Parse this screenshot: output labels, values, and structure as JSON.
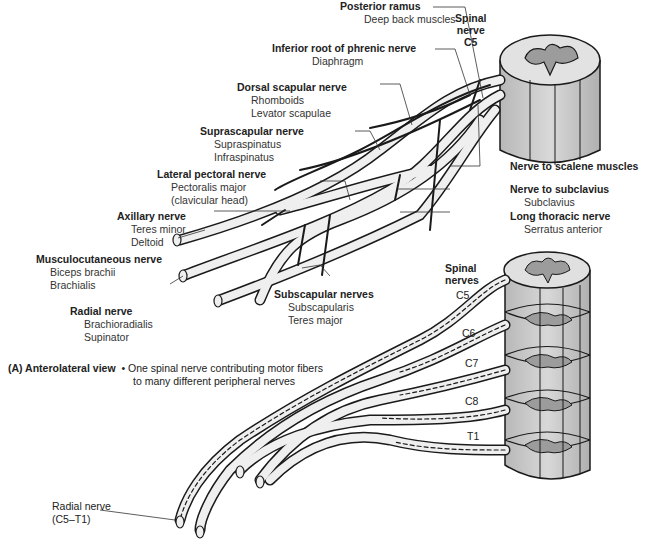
{
  "figure": {
    "panel_label": "(A) Anterolateral view",
    "caption_note": "• One spinal nerve contributing motor fibers",
    "caption_note_2": "to many different peripheral nerves"
  },
  "top_diagram": {
    "spinal_label": {
      "line1": "Spinal",
      "line2": "nerve",
      "segment": "C5"
    },
    "labels": [
      {
        "title": "Posterior ramus",
        "sub": [
          "Deep back muscles"
        ]
      },
      {
        "title": "Inferior root of phrenic nerve",
        "sub": [
          "Diaphragm"
        ]
      },
      {
        "title": "Dorsal scapular nerve",
        "sub": [
          "Rhomboids",
          "Levator scapulae"
        ]
      },
      {
        "title": "Suprascapular nerve",
        "sub": [
          "Supraspinatus",
          "Infraspinatus"
        ]
      },
      {
        "title": "Lateral pectoral nerve",
        "sub": [
          "Pectoralis major",
          "(clavicular head)"
        ]
      },
      {
        "title": "Axillary nerve",
        "sub": [
          "Teres minor",
          "Deltoid"
        ]
      },
      {
        "title": "Musculocutaneous nerve",
        "sub": [
          "Biceps brachii",
          "Brachialis"
        ]
      },
      {
        "title": "Radial nerve",
        "sub": [
          "Brachioradialis",
          "Supinator"
        ]
      },
      {
        "title": "Subscapular nerves",
        "sub": [
          "Subscapularis",
          "Teres major"
        ]
      },
      {
        "title": "Nerve to scalene muscles",
        "sub": []
      },
      {
        "title": "Nerve to subclavius",
        "sub": [
          "Subclavius"
        ]
      },
      {
        "title": "Long thoracic nerve",
        "sub": [
          "Serratus anterior"
        ]
      }
    ]
  },
  "bottom_diagram": {
    "spinal_label": {
      "line1": "Spinal",
      "line2": "nerves"
    },
    "segments": [
      "C5",
      "C6",
      "C7",
      "C8",
      "T1"
    ],
    "radial_label": {
      "line1": "Radial nerve",
      "line2": "(C5–T1)"
    }
  },
  "colors": {
    "outline": "#1a1a1a",
    "nerve_fill": "#efefef",
    "cord_fill": "#c8c8c8",
    "cord_top": "#dcdcdc",
    "gray_matter": "#9a9a9a"
  }
}
